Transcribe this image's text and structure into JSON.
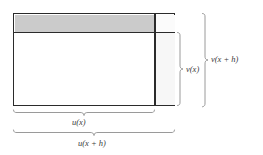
{
  "figure": {
    "background_color": "#ffffff"
  },
  "regions": {
    "shaded_band": {
      "name": "top shaded strip",
      "fill": "#cbcbcb",
      "meaning": "u(x) times the increase in v"
    },
    "corner_box": {
      "name": "top right corner box",
      "fill": "#fbfbfb",
      "meaning": "increase in u times increase in v"
    },
    "right_strip": {
      "name": "right vertical strip",
      "fill": "#f7f7f7",
      "meaning": "v(x) times the increase in u"
    },
    "main_area": {
      "name": "main inner rectangle",
      "fill": "#ffffff",
      "meaning": "u(x) times v(x)"
    },
    "outline_color": "#2b2b2b"
  },
  "braces": {
    "color": "#8e8e8e",
    "items": [
      {
        "id": "v-of-x",
        "orientation": "vertical",
        "label": "v(x)"
      },
      {
        "id": "v-of-x-plus-h",
        "orientation": "vertical",
        "label": "v(x + h)"
      },
      {
        "id": "u-of-x",
        "orientation": "horizontal",
        "label": "u(x)"
      },
      {
        "id": "u-of-x-plus-h",
        "orientation": "horizontal",
        "label": "u(x + h)"
      }
    ]
  },
  "labels": {
    "v_of_x": "v(x)",
    "v_of_x_plus_h": "v(x + h)",
    "u_of_x": "u(x)",
    "u_of_x_plus_h": "u(x + h)"
  }
}
